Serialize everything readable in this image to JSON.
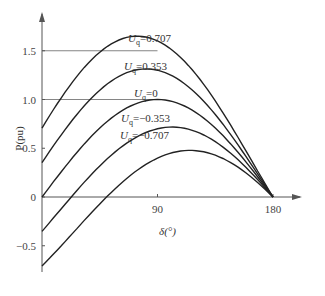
{
  "chart_data": {
    "type": "line",
    "title": "",
    "xlabel": "δ(°)",
    "ylabel": "P(pu)",
    "xlim": [
      0,
      190
    ],
    "ylim": [
      -0.75,
      1.85
    ],
    "x_ticks": [
      90,
      180
    ],
    "y_ticks": [
      1.5,
      1.0,
      0.5,
      0,
      -0.5
    ],
    "y_tick_labels": [
      "1.5",
      "1.0",
      "0.5",
      "0",
      "−0.5"
    ],
    "reference_lines": [
      1.5,
      1.0
    ],
    "grid": false,
    "legend": "inline labels",
    "series": [
      {
        "name": "Uq=0.707",
        "uq": 0.707,
        "start": 0.707,
        "end": 0,
        "peak": 1.5,
        "label_sub": "q",
        "label_value": "=0.707"
      },
      {
        "name": "Uq=0.353",
        "uq": 0.353,
        "start": 0.353,
        "end": 0,
        "peak": 1.25,
        "label_sub": "q",
        "label_value": "=0.353"
      },
      {
        "name": "Uq=0",
        "uq": 0,
        "start": 0,
        "end": 0,
        "peak": 1.0,
        "label_sub": "q",
        "label_value": "=0"
      },
      {
        "name": "Uq=-0.353",
        "uq": -0.353,
        "start": -0.353,
        "end": 0,
        "peak": 0.78,
        "label_sub": "q",
        "label_value": "=−0.353"
      },
      {
        "name": "Uq=-0.707",
        "uq": -0.707,
        "start": -0.707,
        "end": 0,
        "peak": 0.55,
        "label_sub": "q",
        "label_value": "=−0.707"
      }
    ]
  },
  "labels": {
    "x_axis": "δ(°)",
    "y_axis": "P(pu)",
    "u_symbol": "U"
  }
}
